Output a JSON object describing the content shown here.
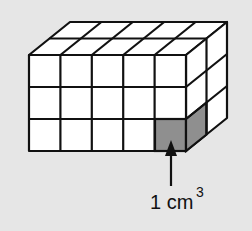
{
  "figure": {
    "dimensions": {
      "length": 5,
      "height": 3,
      "depth": 2
    },
    "highlighted_cube": {
      "position": "front bottom right",
      "color": "#8f8f8f"
    },
    "annotation": {
      "value": "1 cm",
      "exponent": "3"
    },
    "colors": {
      "background": "#e6e6e6",
      "cube_face": "#ffffff",
      "stroke": "#111111"
    }
  }
}
